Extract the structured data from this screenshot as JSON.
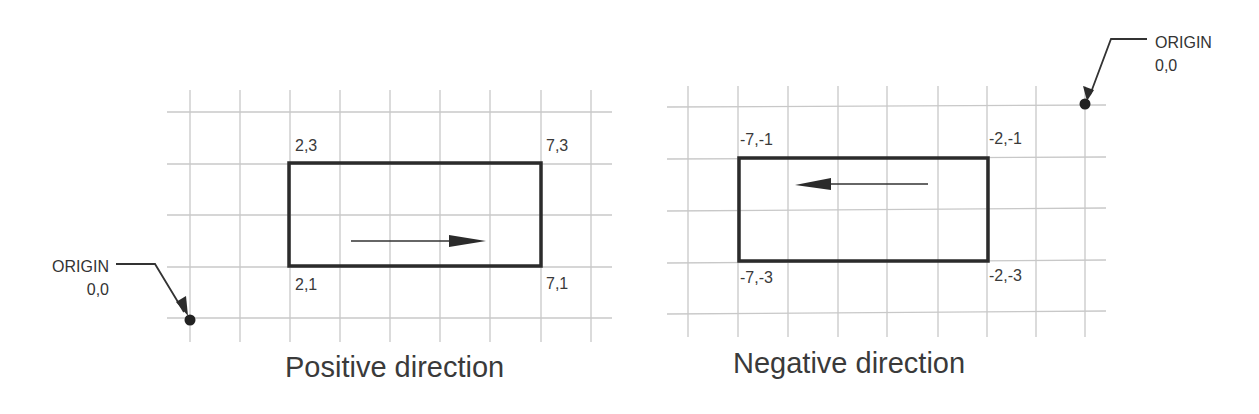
{
  "diagrams": [
    {
      "id": "positive",
      "caption": "Positive direction",
      "origin": {
        "label": "ORIGIN",
        "coords": "0,0"
      },
      "corners": {
        "top_left": "2,3",
        "top_right": "7,3",
        "bottom_left": "2,1",
        "bottom_right": "7,1"
      },
      "arrow_direction": "right"
    },
    {
      "id": "negative",
      "caption": "Negative direction",
      "origin": {
        "label": "ORIGIN",
        "coords": "0,0"
      },
      "corners": {
        "top_left": "-7,-1",
        "top_right": "-2,-1",
        "bottom_left": "-7,-3",
        "bottom_right": "-2,-3"
      },
      "arrow_direction": "left"
    }
  ],
  "colors": {
    "grid": "#c8c8c8",
    "outline": "#2b2b2b",
    "text": "#3a3a3a"
  }
}
